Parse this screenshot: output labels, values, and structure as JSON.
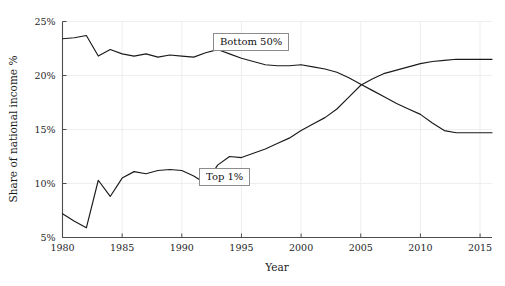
{
  "chart_data": {
    "type": "line",
    "title": "",
    "xlabel": "Year",
    "ylabel": "Share of national income %",
    "xlim": [
      1980,
      2016
    ],
    "ylim": [
      5,
      25
    ],
    "grid": true,
    "legend_position": "inline-boxed-labels",
    "x_ticks": [
      1980,
      1985,
      1990,
      1995,
      2000,
      2005,
      2010,
      2015
    ],
    "x_tick_labels": [
      "1980",
      "1985",
      "1990",
      "1995",
      "2000",
      "2005",
      "2010",
      "2015"
    ],
    "y_ticks": [
      5,
      10,
      15,
      20,
      25
    ],
    "y_tick_labels": [
      "5%",
      "10%",
      "15%",
      "20%",
      "25%"
    ],
    "x": [
      1980,
      1981,
      1982,
      1983,
      1984,
      1985,
      1986,
      1987,
      1988,
      1989,
      1990,
      1991,
      1992,
      1993,
      1994,
      1995,
      1996,
      1997,
      1998,
      1999,
      2000,
      2001,
      2002,
      2003,
      2004,
      2005,
      2006,
      2007,
      2008,
      2009,
      2010,
      2011,
      2012,
      2013,
      2014,
      2015,
      2016
    ],
    "series": [
      {
        "name": "Bottom 50%",
        "label": "Bottom 50%",
        "color": "#1a1a1a",
        "values": [
          23.4,
          23.5,
          23.7,
          21.8,
          22.4,
          22.0,
          21.8,
          22.0,
          21.7,
          21.9,
          21.8,
          21.7,
          22.1,
          22.4,
          22.0,
          21.6,
          21.3,
          21.0,
          20.9,
          20.9,
          21.0,
          20.8,
          20.6,
          20.3,
          19.8,
          19.2,
          18.6,
          18.0,
          17.4,
          16.9,
          16.4,
          15.6,
          14.9,
          14.7,
          14.7,
          14.7,
          14.7
        ]
      },
      {
        "name": "Top 1%",
        "label": "Top 1%",
        "color": "#1a1a1a",
        "values": [
          7.2,
          6.5,
          5.9,
          10.3,
          8.8,
          10.5,
          11.1,
          10.9,
          11.2,
          11.3,
          11.2,
          10.7,
          10.0,
          11.7,
          12.5,
          12.4,
          12.8,
          13.2,
          13.7,
          14.2,
          14.9,
          15.5,
          16.1,
          16.9,
          18.0,
          19.1,
          19.7,
          20.2,
          20.5,
          20.8,
          21.1,
          21.3,
          21.4,
          21.5,
          21.5,
          21.5,
          21.5
        ]
      }
    ],
    "annotations": [
      {
        "text": "Bottom 50%",
        "kind": "boxed-label"
      },
      {
        "text": "Top 1%",
        "kind": "boxed-label"
      }
    ]
  },
  "axes": {
    "ylabel": "Share of national income %",
    "xlabel": "Year"
  },
  "legend": {
    "bottom50_label": "Bottom 50%",
    "top1_label": "Top 1%"
  }
}
